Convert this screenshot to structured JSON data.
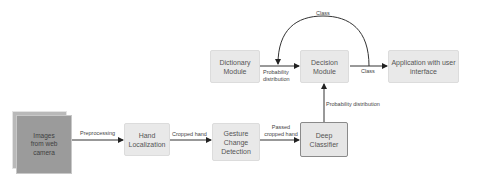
{
  "diagram": {
    "type": "flowchart",
    "nodes": {
      "images": {
        "label": "Images from web camera",
        "lines": [
          "Images",
          "from web",
          "camera"
        ]
      },
      "hand_localization": {
        "label": "Hand Localization",
        "lines": [
          "Hand",
          "Localization"
        ]
      },
      "gesture_change": {
        "label": "Gesture Change Detection",
        "lines": [
          "Gesture",
          "Change",
          "Detection"
        ]
      },
      "deep_classifier": {
        "label": "Deep Classifier",
        "lines": [
          "Deep",
          "Classifier"
        ]
      },
      "dictionary": {
        "label": "Dictionary Module",
        "lines": [
          "Dictionary",
          "Module"
        ]
      },
      "decision": {
        "label": "Decision Module",
        "lines": [
          "Decision",
          "Module"
        ]
      },
      "application": {
        "label": "Application with user interface",
        "lines": [
          "Application with user",
          "interface"
        ]
      }
    },
    "edges": [
      {
        "from": "images",
        "to": "hand_localization",
        "label": "Preprocessing"
      },
      {
        "from": "hand_localization",
        "to": "gesture_change",
        "label": "Cropped hand"
      },
      {
        "from": "gesture_change",
        "to": "deep_classifier",
        "label": "Passed cropped hand",
        "lines": [
          "Passed",
          "cropped hand"
        ]
      },
      {
        "from": "deep_classifier",
        "to": "decision",
        "label": "Probability distribution"
      },
      {
        "from": "dictionary",
        "to": "decision",
        "label": "Probability distribution",
        "lines": [
          "Probability",
          "distribution"
        ]
      },
      {
        "from": "decision",
        "to": "application",
        "label": "Class"
      },
      {
        "from": "decision",
        "to": "dictionary",
        "label": "Class",
        "style": "arc"
      }
    ],
    "colors": {
      "box_fill": "#e9e9e9",
      "image_front_fill": "#9b9b9b",
      "image_back_fill": "#b9b9b9",
      "arrow": "#333333",
      "text": "#555555"
    }
  }
}
